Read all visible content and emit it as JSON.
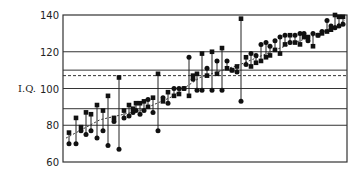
{
  "chart_data": {
    "type": "scatter",
    "title": "",
    "xlabel": "",
    "ylabel": "I.Q.",
    "ylim": [
      60,
      140
    ],
    "yticks": [
      60,
      80,
      100,
      120,
      140
    ],
    "grid": "horizontal lines at 140, 120, 110, 100, 89, 80, 60",
    "reference_lines": [
      {
        "value": 110,
        "style": "solid"
      },
      {
        "value": 107,
        "style": "dashed"
      },
      {
        "value": 89,
        "style": "solid"
      }
    ],
    "legend": [],
    "series": [
      {
        "name": "square",
        "marker": "square"
      },
      {
        "name": "circle",
        "marker": "circle"
      },
      {
        "name": "trend",
        "style": "dashed"
      }
    ],
    "pairs": [
      {
        "x": 69,
        "square": 76,
        "circle": 70
      },
      {
        "x": 76,
        "square": 84,
        "circle": 70
      },
      {
        "x": 81,
        "square": 79,
        "circle": 77
      },
      {
        "x": 86,
        "square": 87,
        "circle": 75
      },
      {
        "x": 91,
        "square": 86,
        "circle": 77
      },
      {
        "x": 97,
        "square": 91,
        "circle": 73
      },
      {
        "x": 103,
        "square": 88,
        "circle": 77
      },
      {
        "x": 108,
        "square": 96,
        "circle": 69
      },
      {
        "x": 114,
        "square": 84,
        "circle": 82
      },
      {
        "x": 119,
        "square": 106,
        "circle": 67
      },
      {
        "x": 124,
        "square": 88,
        "circle": 84
      },
      {
        "x": 129,
        "square": 91,
        "circle": 85
      },
      {
        "x": 133,
        "square": 89,
        "circle": 87
      },
      {
        "x": 136,
        "square": 92,
        "circle": 88
      },
      {
        "x": 140,
        "square": 92,
        "circle": 86
      },
      {
        "x": 144,
        "square": 93,
        "circle": 88
      },
      {
        "x": 148,
        "square": 90,
        "circle": 94
      },
      {
        "x": 153,
        "square": 95,
        "circle": 87
      },
      {
        "x": 158,
        "square": 108,
        "circle": 77
      },
      {
        "x": 163,
        "square": 93,
        "circle": 95
      },
      {
        "x": 168,
        "square": 98,
        "circle": 92
      },
      {
        "x": 174,
        "square": 96,
        "circle": 100
      },
      {
        "x": 179,
        "square": 97,
        "circle": 100
      },
      {
        "x": 184,
        "square": 100,
        "circle": 100
      },
      {
        "x": 189,
        "square": 96,
        "circle": 117
      },
      {
        "x": 193,
        "square": 107,
        "circle": 105
      },
      {
        "x": 197,
        "square": 108,
        "circle": 99
      },
      {
        "x": 202,
        "square": 119,
        "circle": 99
      },
      {
        "x": 207,
        "square": 107,
        "circle": 111
      },
      {
        "x": 212,
        "square": 120,
        "circle": 99
      },
      {
        "x": 217,
        "square": 108,
        "circle": 115
      },
      {
        "x": 222,
        "square": 122,
        "circle": 99
      },
      {
        "x": 227,
        "square": 111,
        "circle": 115
      },
      {
        "x": 232,
        "square": 110,
        "circle": 110
      },
      {
        "x": 237,
        "square": 112,
        "circle": 109
      },
      {
        "x": 241,
        "square": 138,
        "circle": 93
      },
      {
        "x": 246,
        "square": 117,
        "circle": 113
      },
      {
        "x": 251,
        "square": 112,
        "circle": 119
      },
      {
        "x": 256,
        "square": 114,
        "circle": 118
      },
      {
        "x": 261,
        "square": 115,
        "circle": 124
      },
      {
        "x": 266,
        "square": 117,
        "circle": 125
      },
      {
        "x": 270,
        "square": 118,
        "circle": 123
      },
      {
        "x": 275,
        "square": 121,
        "circle": 126
      },
      {
        "x": 280,
        "square": 119,
        "circle": 128
      },
      {
        "x": 285,
        "square": 124,
        "circle": 129
      },
      {
        "x": 290,
        "square": 129,
        "circle": 125
      },
      {
        "x": 295,
        "square": 125,
        "circle": 129
      },
      {
        "x": 300,
        "square": 124,
        "circle": 130
      },
      {
        "x": 304,
        "square": 128,
        "circle": 130
      },
      {
        "x": 308,
        "square": 128,
        "circle": 126
      },
      {
        "x": 313,
        "square": 123,
        "circle": 130
      },
      {
        "x": 318,
        "square": 129,
        "circle": 129
      },
      {
        "x": 322,
        "square": 130,
        "circle": 131
      },
      {
        "x": 327,
        "square": 131,
        "circle": 137
      },
      {
        "x": 331,
        "square": 132,
        "circle": 134
      },
      {
        "x": 335,
        "square": 140,
        "circle": 133
      },
      {
        "x": 339,
        "square": 139,
        "circle": 134
      },
      {
        "x": 343,
        "square": 139,
        "circle": 135
      }
    ],
    "trend": [
      {
        "x": 66,
        "y": 73
      },
      {
        "x": 100,
        "y": 83
      },
      {
        "x": 140,
        "y": 88
      },
      {
        "x": 170,
        "y": 95
      },
      {
        "x": 200,
        "y": 106
      },
      {
        "x": 240,
        "y": 113
      },
      {
        "x": 280,
        "y": 122
      },
      {
        "x": 320,
        "y": 130
      },
      {
        "x": 345,
        "y": 137
      }
    ]
  }
}
